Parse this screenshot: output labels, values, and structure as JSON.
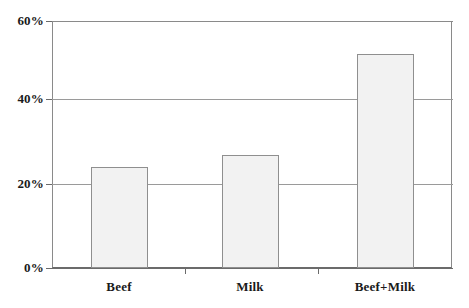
{
  "chart_data": {
    "type": "bar",
    "title": "",
    "subtitle": "",
    "xlabel": "",
    "ylabel": "",
    "categories": [
      "Beef",
      "Milk",
      "Beef+Milk"
    ],
    "values": [
      24.5,
      27.5,
      52.0
    ],
    "value_labels": [
      "24.5%",
      "27.5%",
      "52%"
    ],
    "series": [
      {
        "name": "",
        "values": [
          24.5,
          27.5,
          52.0
        ]
      }
    ],
    "ylim": [
      0,
      60
    ],
    "yticks": [
      0,
      20,
      40,
      60
    ],
    "ytick_labels": [
      "0%",
      "20%",
      "40%",
      "60%"
    ],
    "grid": true,
    "grid_axis": "y",
    "legend": false,
    "legend_position": "none",
    "bar_fill_color": "#f2f2f2",
    "bar_border_color": "#8f8f8f",
    "axis_color": "#6b6b6b",
    "gridline_color": "#9a9a9a",
    "background_color": "#ffffff",
    "annotations": []
  },
  "axis": {
    "y": {
      "ticks": [
        {
          "label": "60%",
          "value": 60
        },
        {
          "label": "40%",
          "value": 40
        },
        {
          "label": "20%",
          "value": 20
        },
        {
          "label": "0%",
          "value": 0
        }
      ]
    },
    "x": {
      "ticks": [
        {
          "label": "Beef"
        },
        {
          "label": "Milk"
        },
        {
          "label": "Beef+Milk"
        }
      ]
    }
  }
}
